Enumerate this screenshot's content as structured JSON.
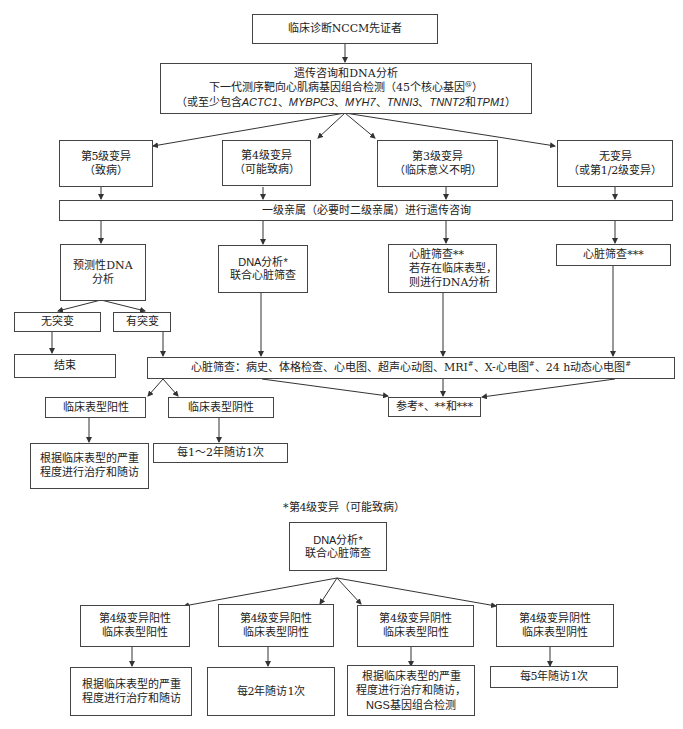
{
  "flowchart": {
    "proband": "临床诊断NCCM先证者",
    "genetic_testing": {
      "line1": "遗传咨询和DNA分析",
      "line2_prefix": "下一代测序靶向心肌病基因组合检测（45个核心基因",
      "line2_sup": "@",
      "line2_suffix": "）",
      "line3_prefix": "（或至少包含",
      "genes": [
        "ACTC1",
        "MYBPC3",
        "MYH7",
        "TNNI3",
        "TNNT2",
        "TPM1"
      ],
      "sep": "、",
      "and": "和",
      "line3_suffix": "）"
    },
    "variant_classes": [
      {
        "line1": "第5级变异",
        "line2": "（致病）"
      },
      {
        "line1": "第4级变异",
        "line2": "（可能致病）"
      },
      {
        "line1": "第3级变异",
        "line2": "（临床意义不明）"
      },
      {
        "line1": "无变异",
        "line2": "（或第1/2级变异）"
      }
    ],
    "relatives_counseling": "一级亲属（必要时二级亲属）进行遗传咨询",
    "actions": [
      {
        "line1": "预测性DNA",
        "line2": "分析"
      },
      {
        "line1": "DNA分析*",
        "line2": "联合心脏筛查"
      },
      {
        "line1": "心脏筛查**",
        "line2": "若存在临床表型，",
        "line3": "则进行DNA分析"
      },
      {
        "line1": "心脏筛查***"
      }
    ],
    "mutation_results": {
      "none": "无突变",
      "present": "有突变"
    },
    "end": "结束",
    "cardiac_screening": {
      "prefix": "心脏筛查：病史、体格检查、心电图、超声心动图、MRI",
      "sup1": "#",
      "mid1": "、X-心电图",
      "sup2": "#",
      "mid2": "、24 h动态心电图",
      "sup3": "#"
    },
    "phenotype": {
      "positive": "临床表型阳性",
      "negative": "临床表型阴性"
    },
    "reference": "参考*、**和***",
    "treat_follow": {
      "line1": "根据临床表型的严重",
      "line2": "程度进行治疗和随访"
    },
    "follow_up_1_2": "每1～2年随访1次",
    "footnote_title": "*第4级变异（可能致病）",
    "class4_box": {
      "line1": "DNA分析*",
      "line2": "联合心脏筛查"
    },
    "class4_outcomes": [
      {
        "line1": "第4级变异阳性",
        "line2": "临床表型阳性"
      },
      {
        "line1": "第4级变异阳性",
        "line2": "临床表型阴性"
      },
      {
        "line1": "第4级变异阴性",
        "line2": "临床表型阳性"
      },
      {
        "line1": "第4级变异阴性",
        "line2": "临床表型阴性"
      }
    ],
    "class4_actions": [
      {
        "line1": "根据临床表型的严重",
        "line2": "程度进行治疗和随访"
      },
      {
        "line1": "每2年随访1次"
      },
      {
        "line1": "根据临床表型的严重",
        "line2": "程度进行治疗和随访，",
        "line3": "NGS基因组合检测"
      },
      {
        "line1": "每5年随访1次"
      }
    ]
  },
  "colors": {
    "line": "#333333",
    "border": "#444444",
    "text": "#222222",
    "background": "#ffffff"
  }
}
